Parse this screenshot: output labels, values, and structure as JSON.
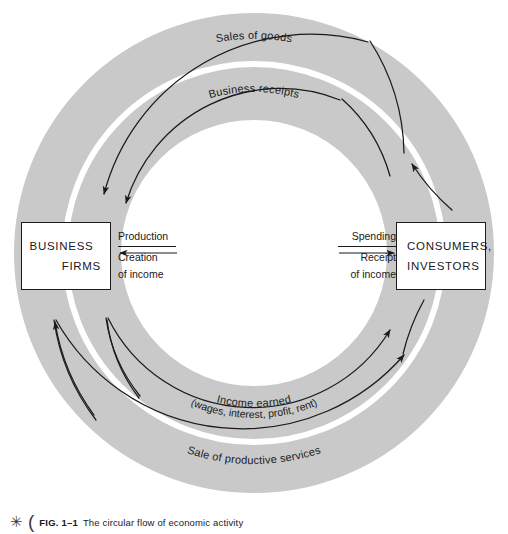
{
  "figure": {
    "caption_mark": "✳",
    "caption_paren": "(",
    "caption_number": "FIG. 1–1",
    "caption_text": "The circular flow of economic activity"
  },
  "colors": {
    "band": "#c9c9c9",
    "band_gap": "#ffffff",
    "stroke": "#1a1a1a",
    "background": "#ffffff"
  },
  "entities": {
    "left": {
      "name": "business-firms",
      "line_1": "BUSINESS",
      "line_2": "FIRMS"
    },
    "right": {
      "name": "consumers-investors",
      "line_1": "CONSUMERS,",
      "line_2": "INVESTORS"
    }
  },
  "center_flows": {
    "left": {
      "direction": "left",
      "above": "Production",
      "below_line_1": "Creation",
      "below_line_2": "of income"
    },
    "right": {
      "direction": "right",
      "above": "Spending",
      "below_line_1": "Receipt",
      "below_line_2": "of income"
    }
  },
  "arc_labels": {
    "outer_top": "Sales of goods",
    "inner_top": "Business receipts",
    "inner_bottom_line_1": "Income earned",
    "inner_bottom_line_2": "(wages, interest, profit, rent)",
    "outer_bottom": "Sale of productive services"
  },
  "ring_geometry": {
    "center_x": 254,
    "center_y": 253,
    "outer_radius": 240,
    "band_gap_radius": 186,
    "inner_radius": 133
  }
}
